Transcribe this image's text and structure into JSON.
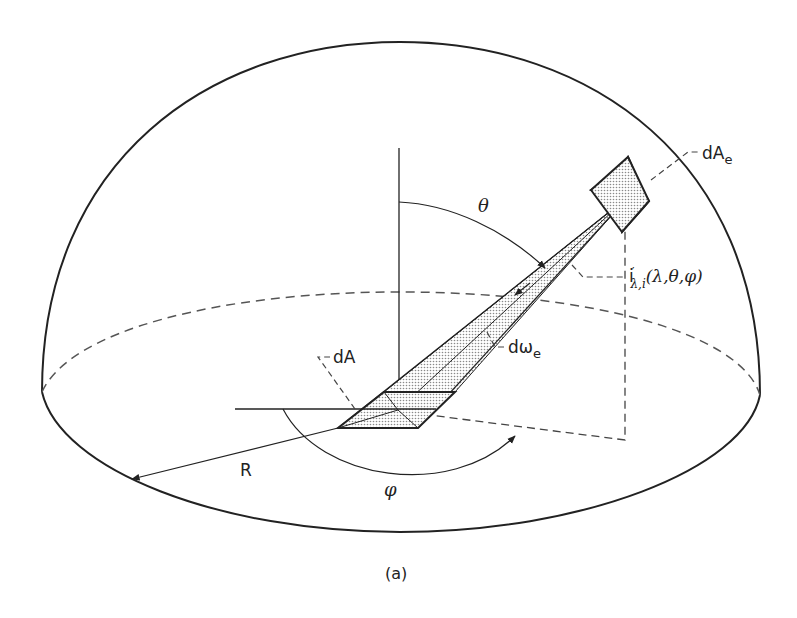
{
  "figure": {
    "caption": "(a)"
  },
  "labels": {
    "dAe": "dA",
    "dAe_sub": "e",
    "dA": "dA",
    "theta": "θ",
    "phi": "φ",
    "R": "R",
    "domega": "dω",
    "domega_sub": "e",
    "intensity_i": "i",
    "intensity_prime": "′",
    "intensity_sub": "λ,i",
    "intensity_args": "(λ,θ,φ)"
  },
  "colors": {
    "ink": "#222222",
    "shade": "#bdbdbd",
    "background": "#ffffff"
  }
}
